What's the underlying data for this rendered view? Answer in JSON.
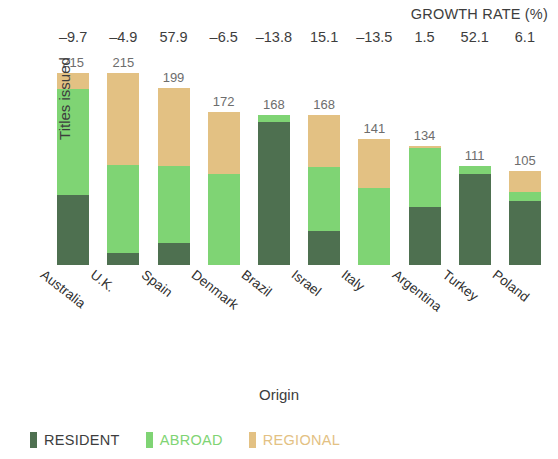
{
  "chart_data": {
    "type": "bar",
    "subtype": "stacked-bar",
    "title": "",
    "xlabel": "Origin",
    "ylabel": "Titles issued",
    "ylim": [
      0,
      230
    ],
    "grid": false,
    "legend_position": "bottom-left",
    "categories": [
      "Australia",
      "U.K.",
      "Spain",
      "Denmark",
      "Brazil",
      "Israel",
      "Italy",
      "Argentina",
      "Turkey",
      "Poland"
    ],
    "totals": [
      215,
      215,
      199,
      172,
      168,
      168,
      141,
      134,
      111,
      105
    ],
    "series": [
      {
        "name": "RESIDENT",
        "color": "#4e7050",
        "values": [
          79,
          14,
          25,
          0,
          160,
          38,
          0,
          65,
          102,
          72
        ]
      },
      {
        "name": "ABROAD",
        "color": "#7fd474",
        "values": [
          118,
          98,
          86,
          102,
          8,
          72,
          86,
          66,
          9,
          10
        ]
      },
      {
        "name": "REGIONAL",
        "color": "#e3c183",
        "values": [
          18,
          103,
          88,
          70,
          0,
          58,
          55,
          3,
          0,
          23
        ]
      }
    ],
    "annotation_row": {
      "title": "GROWTH RATE (%)",
      "values": [
        "–9.7",
        "–4.9",
        "57.9",
        "–6.5",
        "–13.8",
        "15.1",
        "–13.5",
        "1.5",
        "52.1",
        "6.1"
      ]
    },
    "legend": [
      {
        "label": "RESIDENT",
        "color": "#4e7050"
      },
      {
        "label": "ABROAD",
        "color": "#7fd474"
      },
      {
        "label": "REGIONAL",
        "color": "#e3c183"
      }
    ]
  }
}
